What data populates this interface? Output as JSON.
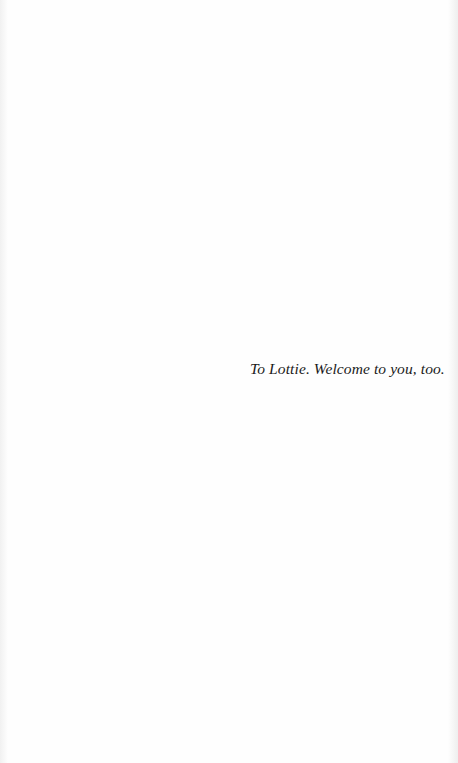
{
  "page": {
    "dedication": "To Lottie. Welcome to you, too."
  }
}
